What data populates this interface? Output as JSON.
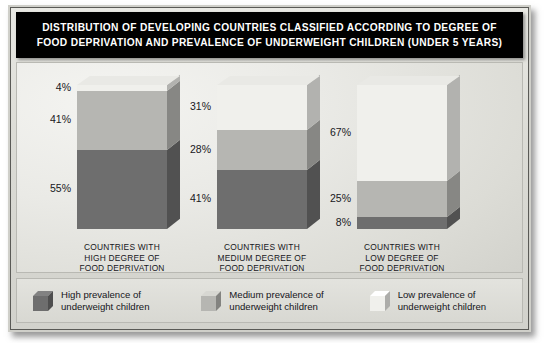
{
  "title": {
    "line1": "DISTRIBUTION OF DEVELOPING COUNTRIES CLASSIFIED ACCORDING TO DEGREE OF",
    "line2": "FOOD DEPRIVATION AND PREVALENCE OF UNDERWEIGHT CHILDREN (UNDER 5 YEARS)"
  },
  "colors": {
    "high": "#6e6e6e",
    "medium": "#b6b6b2",
    "low": "#f0f0ec",
    "title_bg": "#000000",
    "title_text": "#ffffff",
    "frame_border": "#5a5a56"
  },
  "legend": {
    "items": [
      {
        "swatch": "high-prevalence-swatch",
        "line1": "High prevalence of",
        "line2": "underweight children",
        "color": "#6e6e6e"
      },
      {
        "swatch": "medium-prevalence-swatch",
        "line1": "Medium prevalence of",
        "line2": "underweight children",
        "color": "#b6b6b2"
      },
      {
        "swatch": "low-prevalence-swatch",
        "line1": "Low prevalence of",
        "line2": "underweight children",
        "color": "#f0f0ec"
      }
    ]
  },
  "chart_data": {
    "type": "bar",
    "stacked": true,
    "title": "DISTRIBUTION OF DEVELOPING COUNTRIES CLASSIFIED ACCORDING TO DEGREE OF FOOD DEPRIVATION AND PREVALENCE OF UNDERWEIGHT CHILDREN (UNDER 5 YEARS)",
    "xlabel": "",
    "ylabel": "",
    "ylim": [
      0,
      100
    ],
    "grid": false,
    "legend_position": "bottom",
    "units": "percent",
    "categories": [
      {
        "line1": "COUNTRIES WITH",
        "line2": "HIGH DEGREE OF",
        "line3": "FOOD DEPRIVATION"
      },
      {
        "line1": "COUNTRIES WITH",
        "line2": "MEDIUM DEGREE OF",
        "line3": "FOOD DEPRIVATION"
      },
      {
        "line1": "COUNTRIES WITH",
        "line2": "LOW DEGREE OF",
        "line3": "FOOD DEPRIVATION"
      }
    ],
    "series": [
      {
        "name": "High prevalence of underweight children",
        "values": [
          55,
          41,
          8
        ],
        "labels": [
          "55%",
          "41%",
          "8%"
        ]
      },
      {
        "name": "Medium prevalence of underweight children",
        "values": [
          41,
          28,
          25
        ],
        "labels": [
          "41%",
          "28%",
          "25%"
        ]
      },
      {
        "name": "Low prevalence of underweight children",
        "values": [
          4,
          31,
          67
        ],
        "labels": [
          "4%",
          "31%",
          "67%"
        ]
      }
    ]
  }
}
